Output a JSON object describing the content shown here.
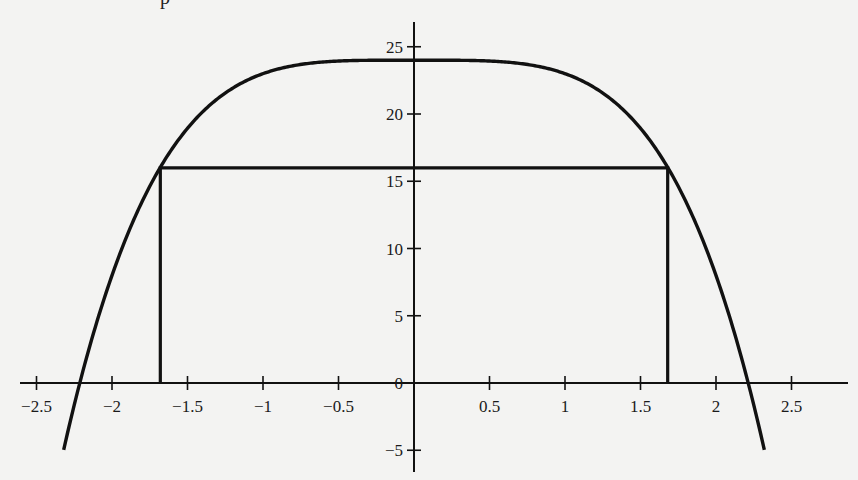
{
  "header_fragment": "p",
  "chart_data": {
    "type": "line",
    "title": "",
    "xlabel": "",
    "ylabel": "",
    "function": "y = 24 - x^4",
    "xlim": [
      -2.6,
      2.85
    ],
    "ylim": [
      -6.6,
      26.8
    ],
    "grid": false,
    "legend": null,
    "x_ticks": [
      -2.5,
      -2,
      -1.5,
      -1,
      -0.5,
      0.5,
      1,
      1.5,
      2,
      2.5
    ],
    "x_tick_labels": [
      "−2.5",
      "−2",
      "−1.5",
      "−1",
      "−0.5",
      "0.5",
      "1",
      "1.5",
      "2",
      "2.5"
    ],
    "y_ticks": [
      -5,
      0,
      5,
      10,
      15,
      20,
      25
    ],
    "y_tick_labels": [
      "−5",
      "0",
      "5",
      "10",
      "15",
      "20",
      "25"
    ],
    "series": [
      {
        "name": "curve",
        "x": [
          -2.32,
          -2.25,
          -2.0,
          -1.75,
          -1.5,
          -1.25,
          -1.0,
          -0.75,
          -0.5,
          0,
          0.5,
          0.75,
          1.0,
          1.25,
          1.5,
          1.75,
          2.0,
          2.25,
          2.32
        ],
        "y": [
          -4.97,
          -1.63,
          8.0,
          14.62,
          18.94,
          21.56,
          23.0,
          23.68,
          23.94,
          24.0,
          23.94,
          23.68,
          23.0,
          21.56,
          18.94,
          14.62,
          8.0,
          -1.63,
          -4.97
        ]
      },
      {
        "name": "inscribed-rectangle",
        "x": [
          -1.68,
          -1.68,
          1.68,
          1.68
        ],
        "y": [
          0,
          16,
          16,
          0
        ]
      }
    ],
    "annotations": {
      "rectangle_corners": [
        [
          -1.68,
          0
        ],
        [
          -1.68,
          16
        ],
        [
          1.68,
          16
        ],
        [
          1.68,
          0
        ]
      ],
      "x_intercepts": [
        -2.21,
        2.21
      ],
      "max_value": 24
    },
    "colors": {
      "line": "#111111",
      "background": "#f3f3f2"
    }
  }
}
